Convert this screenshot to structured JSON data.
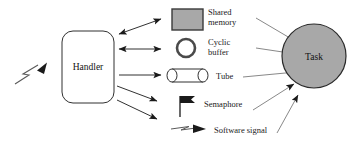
{
  "diagram": {
    "colors": {
      "stroke": "#1a1a1a",
      "shape_fill_gray": "#a8a8a8",
      "shape_fill_white": "#ffffff",
      "text": "#111111",
      "background": "#ffffff"
    },
    "nodes": {
      "handler": {
        "label": "Handler",
        "shape": "rounded-rectangle",
        "fill": "#ffffff"
      },
      "task": {
        "label": "Task",
        "shape": "ellipse",
        "fill": "#a8a8a8"
      }
    },
    "mechanisms": [
      {
        "id": "shared-memory",
        "label_line1": "Shared",
        "label_line2": "memory",
        "icon": "filled-rectangle-icon",
        "handler_link": "bidirectional",
        "task_link": "unidirectional"
      },
      {
        "id": "cyclic-buffer",
        "label_line1": "Cyclic",
        "label_line2": "buffer",
        "icon": "ring-icon",
        "handler_link": "bidirectional",
        "task_link": "unidirectional"
      },
      {
        "id": "tube",
        "label_line1": "Tube",
        "label_line2": "",
        "icon": "cylinder-icon",
        "handler_link": "unidirectional",
        "task_link": "unidirectional"
      },
      {
        "id": "semaphore",
        "label_line1": "Semaphore",
        "label_line2": "",
        "icon": "flag-icon",
        "handler_link": "unidirectional",
        "task_link": "unidirectional"
      },
      {
        "id": "software-signal",
        "label_line1": "Software signal",
        "label_line2": "",
        "icon": "lightning-arrow-icon",
        "handler_link": "unidirectional",
        "task_link": "unidirectional"
      }
    ],
    "external_input": {
      "id": "external-signal",
      "icon": "lightning-arrow-icon",
      "target": "handler"
    }
  }
}
